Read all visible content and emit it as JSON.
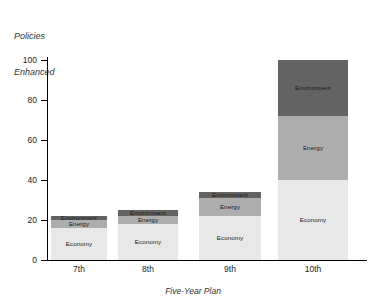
{
  "chart_data": {
    "type": "bar",
    "subtype": "stacked-bar",
    "title": "",
    "ylabel": "Policies Enhanced",
    "xlabel": "Five-Year Plan",
    "categories": [
      "7th",
      "8th",
      "9th",
      "10th"
    ],
    "ylim": [
      0,
      100
    ],
    "yticks": [
      0,
      20,
      40,
      60,
      80,
      100
    ],
    "grid": false,
    "legend": "none (in-segment labels)",
    "series": [
      {
        "name": "Economy",
        "values": [
          16,
          18,
          22,
          40
        ],
        "color": "#e8e8e8"
      },
      {
        "name": "Energy",
        "values": [
          4,
          4,
          9,
          32
        ],
        "color": "#adadad"
      },
      {
        "name": "Environment",
        "values": [
          2,
          3,
          3,
          28
        ],
        "color": "#636363"
      }
    ],
    "totals": [
      22,
      25,
      34,
      100
    ],
    "segment_labels": [
      "Environment",
      "Energy",
      "Economy"
    ]
  },
  "axis": {
    "y_title_line1": "Policies",
    "y_title_line2": "Enhanced",
    "x_title": "Five-Year Plan",
    "tick_labels": [
      "100",
      "80",
      "60",
      "40",
      "20",
      "0"
    ]
  },
  "colors": {
    "economy": "#e8e8e8",
    "energy": "#adadad",
    "environment": "#636363",
    "axis": "#000000",
    "text": "#222222"
  }
}
